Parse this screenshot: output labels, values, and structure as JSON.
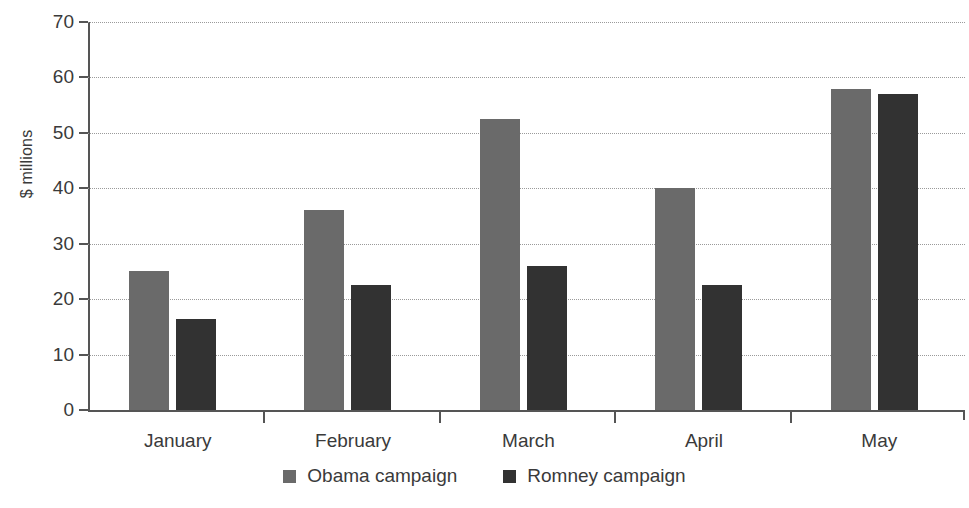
{
  "chart_data": {
    "type": "bar",
    "title": "",
    "subtitle": "",
    "xlabel": "",
    "ylabel": "$ millions",
    "ylim": [
      0,
      70
    ],
    "ytick_step": 10,
    "yticks": [
      0,
      10,
      20,
      30,
      40,
      50,
      60,
      70
    ],
    "grid": true,
    "grid_axis": "y",
    "legend_position": "bottom-center",
    "categories": [
      "January",
      "February",
      "March",
      "April",
      "May"
    ],
    "series": [
      {
        "name": "Obama campaign",
        "color": "#6a6a6a",
        "values": [
          25,
          36,
          52.5,
          40,
          58
        ]
      },
      {
        "name": "Romney campaign",
        "color": "#323232",
        "values": [
          16.5,
          22.5,
          26,
          22.5,
          57
        ]
      }
    ],
    "annotations": []
  },
  "axis": {
    "y_title": "$ millions",
    "y_tick_labels": [
      "70",
      "60",
      "50",
      "40",
      "30",
      "20",
      "10",
      "0"
    ],
    "x_tick_labels": [
      "January",
      "February",
      "March",
      "April",
      "May"
    ]
  },
  "legend": {
    "items": [
      {
        "label": "Obama campaign",
        "color": "#6a6a6a"
      },
      {
        "label": "Romney campaign",
        "color": "#323232"
      }
    ]
  },
  "colors": {
    "obama": "#6a6a6a",
    "romney": "#323232",
    "axis": "#555555",
    "grid": "#9a9a9a",
    "text": "#3a3a3a",
    "background": "#ffffff"
  }
}
